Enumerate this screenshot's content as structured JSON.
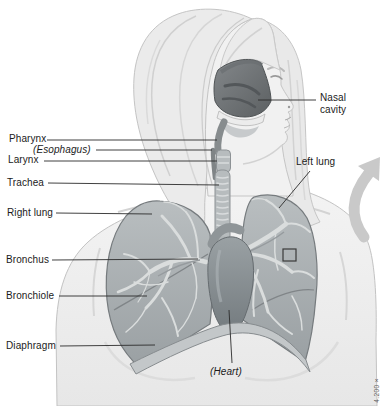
{
  "figure": {
    "labels": {
      "pharynx": "Pharynx",
      "esophagus": "(Esophagus)",
      "larynx": "Larynx",
      "trachea": "Trachea",
      "right_lung": "Right lung",
      "bronchus": "Bronchus",
      "bronchiole": "Bronchiole",
      "diaphragm": "Diaphragm",
      "nasal_cavity": "Nasal cavity",
      "left_lung": "Left lung",
      "heart": "(Heart)"
    },
    "credit": "4.200×"
  }
}
